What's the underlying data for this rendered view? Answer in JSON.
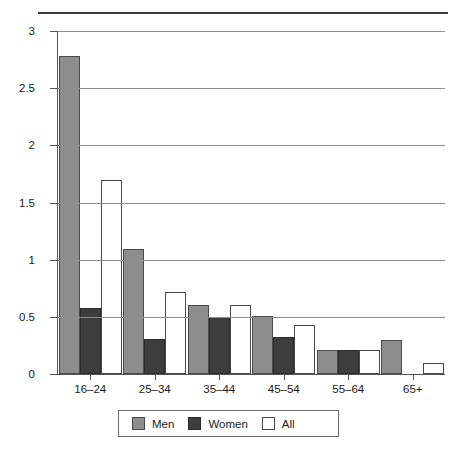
{
  "chart_data": {
    "type": "bar",
    "title": "",
    "subtitle": "",
    "xlabel": "",
    "ylabel": "per cent",
    "categories": [
      "16–24",
      "25–34",
      "35–44",
      "45–54",
      "55–64",
      "65+"
    ],
    "series": [
      {
        "name": "Men",
        "color": "#8d8d8d",
        "values": [
          2.78,
          1.09,
          0.6,
          0.51,
          0.21,
          0.3
        ]
      },
      {
        "name": "Women",
        "color": "#3d3d3d",
        "values": [
          0.58,
          0.31,
          0.5,
          0.32,
          0.21,
          0.0
        ]
      },
      {
        "name": "All",
        "color": "#ffffff",
        "values": [
          1.7,
          0.72,
          0.6,
          0.43,
          0.21,
          0.1
        ]
      }
    ],
    "ylim": [
      0,
      3
    ],
    "yticks": [
      0,
      0.5,
      1,
      1.5,
      2,
      2.5,
      3
    ],
    "ytick_labels": [
      "0",
      "0.5",
      "1",
      "1.5",
      "2",
      "2.5",
      "3"
    ],
    "grid": true,
    "grid_axis": "y",
    "legend_position": "bottom",
    "legend_entries": [
      "Men",
      "Women",
      "All"
    ],
    "bar_border_color": "#4a4a4a",
    "axis_color": "#555555",
    "gridline_color": "#8c8c8c"
  },
  "figure": {
    "top_rule": true,
    "background": "#ffffff"
  }
}
